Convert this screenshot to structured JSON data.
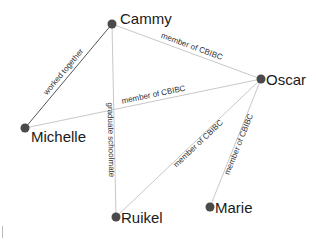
{
  "diagram": {
    "type": "network-graph",
    "colors": {
      "background": "#ffffff",
      "node": "#4a4a4a",
      "edge_dark": "#555555",
      "edge_light": "#c8c8c8",
      "label": "#333333",
      "node_label": "#1a1a1a"
    },
    "nodes": [
      {
        "id": "cammy",
        "label": "Cammy",
        "x": 112,
        "y": 24,
        "r": 4.5,
        "label_dx": 8,
        "label_dy": 0
      },
      {
        "id": "oscar",
        "label": "Oscar",
        "x": 261,
        "y": 79,
        "r": 4.5,
        "label_dx": 5,
        "label_dy": 6
      },
      {
        "id": "michelle",
        "label": "Michelle",
        "x": 25,
        "y": 128,
        "r": 4.5,
        "label_dx": 6,
        "label_dy": 14
      },
      {
        "id": "ruikel",
        "label": "Ruikel",
        "x": 116,
        "y": 217,
        "r": 4.5,
        "label_dx": 5,
        "label_dy": 6
      },
      {
        "id": "marie",
        "label": "Marie",
        "x": 210,
        "y": 207,
        "r": 4.5,
        "label_dx": 5,
        "label_dy": 6
      }
    ],
    "edges": [
      {
        "source": "cammy",
        "target": "michelle",
        "label": "worked together",
        "style": "dark",
        "label_t": 0.5,
        "label_offset": -4
      },
      {
        "source": "cammy",
        "target": "oscar",
        "label": "member of CBIBC",
        "style": "light",
        "label_t": 0.52,
        "label_offset": -4
      },
      {
        "source": "michelle",
        "target": "oscar",
        "label": "member of CBIBC",
        "style": "light",
        "label_t": 0.55,
        "label_offset": -4
      },
      {
        "source": "cammy",
        "target": "ruikel",
        "label": "graduate schoolmate",
        "style": "light",
        "label_t": 0.6,
        "label_offset": 6
      },
      {
        "source": "oscar",
        "target": "ruikel",
        "label": "member of CBIBC",
        "style": "light",
        "label_t": 0.45,
        "label_offset": 6
      },
      {
        "source": "oscar",
        "target": "marie",
        "label": "member of CBIBC",
        "style": "light",
        "label_t": 0.5,
        "label_offset": 6
      }
    ]
  }
}
